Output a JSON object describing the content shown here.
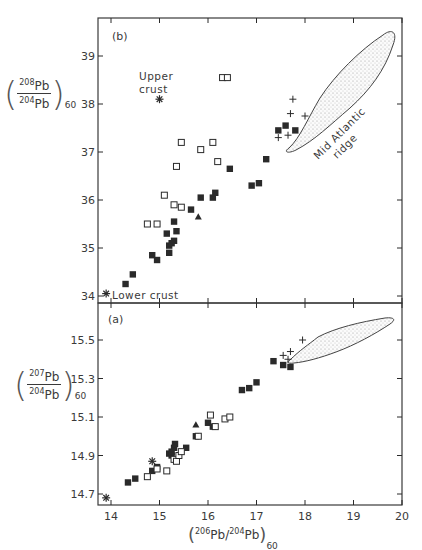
{
  "chart_data": [
    {
      "panel": "(b)",
      "type": "scatter",
      "xlabel": "(206Pb/204Pb)60",
      "ylabel": "(208Pb/204Pb)60",
      "xlim": [
        13.7,
        20
      ],
      "ylim": [
        33.85,
        39.8
      ],
      "xticks": [
        14,
        15,
        16,
        17,
        18,
        19,
        20
      ],
      "yticks": [
        34,
        35,
        36,
        37,
        38,
        39
      ],
      "grid": false,
      "annotations": [
        {
          "text": "Upper crust",
          "x": 15.0,
          "y": 38.1,
          "marker": "asterisk"
        },
        {
          "text": "Lower crust",
          "x": 13.9,
          "y": 34.05,
          "marker": "asterisk"
        },
        {
          "text": "Mid Atlantic ridge",
          "type": "stippled-field"
        }
      ],
      "series": [
        {
          "name": "filled-square",
          "points": [
            [
              14.3,
              34.25
            ],
            [
              14.45,
              34.45
            ],
            [
              14.85,
              34.85
            ],
            [
              14.95,
              34.75
            ],
            [
              15.15,
              35.3
            ],
            [
              15.2,
              35.05
            ],
            [
              15.2,
              34.9
            ],
            [
              15.25,
              35.1
            ],
            [
              15.3,
              35.15
            ],
            [
              15.3,
              35.55
            ],
            [
              15.35,
              35.35
            ],
            [
              15.65,
              35.8
            ],
            [
              15.85,
              36.05
            ],
            [
              16.1,
              36.05
            ],
            [
              16.15,
              36.15
            ],
            [
              16.45,
              36.65
            ],
            [
              16.9,
              36.3
            ],
            [
              17.05,
              36.35
            ],
            [
              17.2,
              36.85
            ],
            [
              17.45,
              37.45
            ],
            [
              17.6,
              37.55
            ],
            [
              17.8,
              37.45
            ]
          ]
        },
        {
          "name": "open-square",
          "points": [
            [
              14.75,
              35.5
            ],
            [
              14.95,
              35.5
            ],
            [
              15.1,
              36.1
            ],
            [
              15.3,
              35.9
            ],
            [
              15.35,
              36.7
            ],
            [
              15.45,
              35.85
            ],
            [
              15.45,
              37.2
            ],
            [
              15.85,
              37.05
            ],
            [
              16.1,
              37.2
            ],
            [
              16.2,
              36.8
            ],
            [
              16.3,
              38.55
            ],
            [
              16.4,
              38.55
            ]
          ]
        },
        {
          "name": "filled-triangle",
          "points": [
            [
              15.8,
              35.65
            ]
          ]
        },
        {
          "name": "plus",
          "points": [
            [
              17.45,
              37.3
            ],
            [
              17.65,
              37.35
            ],
            [
              17.7,
              37.8
            ],
            [
              17.75,
              38.1
            ],
            [
              18.0,
              37.75
            ]
          ]
        }
      ]
    },
    {
      "panel": "(a)",
      "type": "scatter",
      "xlabel": "(206Pb/204Pb)60",
      "ylabel": "(207Pb/204Pb)60",
      "xlim": [
        13.7,
        20
      ],
      "ylim": [
        14.64,
        15.7
      ],
      "xticks": [
        14,
        15,
        16,
        17,
        18,
        19,
        20
      ],
      "yticks": [
        14.7,
        14.9,
        15.1,
        15.3,
        15.5
      ],
      "grid": false,
      "annotations": [
        {
          "text": "Lower crust",
          "x": 13.9,
          "y": 14.68,
          "marker": "asterisk"
        },
        {
          "text": "Upper crust",
          "x": 14.85,
          "y": 14.87,
          "marker": "asterisk"
        },
        {
          "text": "Mid Atlantic ridge",
          "type": "stippled-field"
        }
      ],
      "series": [
        {
          "name": "filled-square",
          "points": [
            [
              14.35,
              14.76
            ],
            [
              14.5,
              14.78
            ],
            [
              14.85,
              14.82
            ],
            [
              14.95,
              14.84
            ],
            [
              15.2,
              14.91
            ],
            [
              15.25,
              14.92
            ],
            [
              15.25,
              14.9
            ],
            [
              15.3,
              14.94
            ],
            [
              15.32,
              14.96
            ],
            [
              15.55,
              14.94
            ],
            [
              15.75,
              15.0
            ],
            [
              16.0,
              15.07
            ],
            [
              16.1,
              15.05
            ],
            [
              16.7,
              15.24
            ],
            [
              16.85,
              15.25
            ],
            [
              17.0,
              15.28
            ],
            [
              17.35,
              15.39
            ],
            [
              17.55,
              15.37
            ],
            [
              17.7,
              15.36
            ]
          ]
        },
        {
          "name": "open-square",
          "points": [
            [
              14.75,
              14.79
            ],
            [
              14.95,
              14.83
            ],
            [
              15.15,
              14.82
            ],
            [
              15.3,
              14.88
            ],
            [
              15.35,
              14.87
            ],
            [
              15.4,
              14.9
            ],
            [
              15.45,
              14.92
            ],
            [
              15.8,
              15.0
            ],
            [
              16.05,
              15.11
            ],
            [
              16.15,
              15.05
            ],
            [
              16.35,
              15.09
            ],
            [
              16.45,
              15.1
            ]
          ]
        },
        {
          "name": "filled-triangle",
          "points": [
            [
              15.75,
              15.06
            ]
          ]
        },
        {
          "name": "plus",
          "points": [
            [
              17.55,
              15.42
            ],
            [
              17.65,
              15.4
            ],
            [
              17.7,
              15.44
            ],
            [
              17.95,
              15.5
            ]
          ]
        }
      ]
    }
  ],
  "labels": {
    "panel_b": "(b)",
    "panel_a": "(a)",
    "upper_crust_line1": "Upper",
    "upper_crust_line2": "crust",
    "lower_crust": "Lower crust",
    "ridge_line1": "Mid Atlantic",
    "ridge_line2": "ridge",
    "x_axis": {
      "open": "(",
      "num1": "206",
      "pb1": "Pb/",
      "num2": "204",
      "pb2": "Pb",
      "close": ")",
      "sub": "60"
    },
    "y_axis_b": {
      "top_mass": "208",
      "top": "Pb",
      "bottom_mass": "204",
      "bottom": "Pb",
      "sub": "60"
    },
    "y_axis_a": {
      "top_mass": "207",
      "top": "Pb",
      "bottom_mass": "204",
      "bottom": "Pb",
      "sub": "60"
    }
  },
  "colors": {
    "ink": "#2a2a2a",
    "stipple": "#9a9a9a",
    "background": "#ffffff"
  }
}
